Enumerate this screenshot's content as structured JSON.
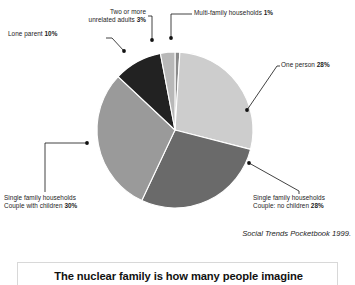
{
  "chart_data": {
    "type": "pie",
    "title": "",
    "source": "Social Trends Pocketbook 1999.",
    "legend_position": "callout-labels",
    "start_angle_deg": 0,
    "direction": "clockwise",
    "categories": [
      "Multi-family households",
      "One person",
      "Single family households Couple: no children",
      "Single family households Couple with children",
      "Lone parent",
      "Two or more unrelated adults"
    ],
    "values": [
      1,
      28,
      28,
      30,
      10,
      3
    ],
    "units": "%",
    "slices": [
      {
        "id": "multi-family",
        "label_line1": "Multi-family households",
        "label_line2": "",
        "value": 1,
        "value_text": "1%",
        "color": "#8a8a8a"
      },
      {
        "id": "one-person",
        "label_line1": "One person",
        "label_line2": "",
        "value": 28,
        "value_text": "28%",
        "color": "#cdcdcd"
      },
      {
        "id": "couple-no-children",
        "label_line1": "Single family households",
        "label_line2": "Couple: no children",
        "value": 28,
        "value_text": "28%",
        "color": "#6a6a6a"
      },
      {
        "id": "couple-with-children",
        "label_line1": "Single family households",
        "label_line2": "Couple with children",
        "value": 30,
        "value_text": "30%",
        "color": "#9a9a9a"
      },
      {
        "id": "lone-parent",
        "label_line1": "Lone parent",
        "label_line2": "",
        "value": 10,
        "value_text": "10%",
        "color": "#222222"
      },
      {
        "id": "two-or-more-unrelated-adults",
        "label_line1": "Two or more",
        "label_line2": "unrelated adults",
        "value": 3,
        "value_text": "3%",
        "color": "#b8b8b8"
      }
    ]
  },
  "labels": {
    "two_adults_line1": "Two or more",
    "two_adults_line2": "unrelated adults",
    "two_adults_value": "3%",
    "lone_parent_text": "Lone parent",
    "lone_parent_value": "10%",
    "multi_family_text": "Multi-family households",
    "multi_family_value": "1%",
    "one_person_text": "One person",
    "one_person_value": "28%",
    "couple_no_children_line1": "Single family households",
    "couple_no_children_line2": "Couple: no children",
    "couple_no_children_value": "28%",
    "couple_with_children_line1": "Single family households",
    "couple_with_children_line2": "Couple with children",
    "couple_with_children_value": "30%"
  },
  "attribution": {
    "text": "Social Trends Pocketbook 1999."
  },
  "caption": {
    "text": "The nuclear family is how many people imagine"
  },
  "colors": {
    "leader_line": "#111111",
    "leader_dot": "#111111",
    "caption_border": "#d8d8d8",
    "text": "#1c1c1c"
  }
}
